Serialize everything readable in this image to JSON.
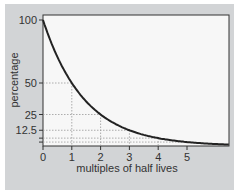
{
  "chart_data": {
    "type": "line",
    "title": "",
    "xlabel": "multiples of half lives",
    "ylabel": "percentage",
    "x_ticks": [
      "0",
      "1",
      "2",
      "3",
      "4",
      "5"
    ],
    "y_ticks": [
      "100",
      "50",
      "25",
      "12.5"
    ],
    "xlim": [
      0,
      6.5
    ],
    "ylim": [
      0,
      100
    ],
    "grid": false,
    "reference_lines": [
      {
        "x": 1,
        "y": 50
      },
      {
        "x": 2,
        "y": 25
      },
      {
        "x": 3,
        "y": 12.5
      },
      {
        "x": 4,
        "y": 6.25
      },
      {
        "x": 5,
        "y": 3.125
      }
    ],
    "series": [
      {
        "name": "decay",
        "x": [
          0,
          1,
          2,
          3,
          4,
          5,
          6
        ],
        "values": [
          100,
          50,
          25,
          12.5,
          6.25,
          3.125,
          1.5625
        ]
      }
    ],
    "colors": {
      "line": "#222222",
      "panel": "#d2d4d6",
      "plot_bg": "#f7f7f7",
      "ref_lines": "#999999"
    }
  }
}
